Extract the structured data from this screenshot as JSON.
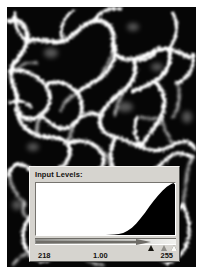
{
  "image": {
    "name": "sem-micrograph",
    "description": "black and white pore-network micrograph",
    "background_color": "#050505",
    "feature_color": "#ffffff"
  },
  "dialog": {
    "title": "Input Levels:",
    "histogram": {
      "name": "input-levels-histogram",
      "fill_color": "#000000",
      "background_color": "#ffffff"
    },
    "slider": {
      "name": "input-levels-slider",
      "black_point_marker": "black-point-marker",
      "gamma_marker": "gamma-marker",
      "white_point_marker": "white-point-marker"
    },
    "values": {
      "black_point": "218",
      "gamma": "1.00",
      "white_point": "255"
    }
  },
  "chart_data": {
    "type": "area",
    "title": "Input Levels:",
    "xlabel": "",
    "ylabel": "",
    "xlim": [
      0,
      255
    ],
    "ylim": [
      0,
      1
    ],
    "grid": false,
    "legend": "none",
    "x": [
      0,
      16,
      32,
      48,
      64,
      80,
      96,
      112,
      128,
      144,
      152,
      160,
      168,
      176,
      184,
      192,
      200,
      208,
      216,
      224,
      232,
      240,
      248,
      252,
      255
    ],
    "values": [
      0.0,
      0.0,
      0.0,
      0.0,
      0.0,
      0.0,
      0.0,
      0.0,
      0.0,
      0.01,
      0.02,
      0.04,
      0.08,
      0.14,
      0.22,
      0.32,
      0.43,
      0.55,
      0.66,
      0.76,
      0.85,
      0.93,
      0.98,
      1.0,
      0.97
    ],
    "annotations": [
      "218",
      "1.00",
      "255"
    ]
  }
}
